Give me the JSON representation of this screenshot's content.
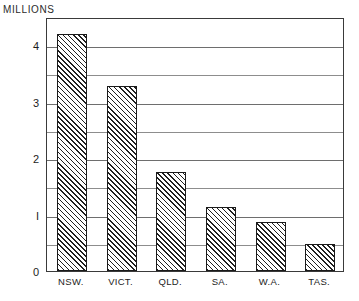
{
  "chart_data": {
    "type": "bar",
    "title": "",
    "axis_title": "MILLIONS",
    "xlabel": "",
    "ylabel": "MILLIONS",
    "categories": [
      "NSW.",
      "VICT.",
      "QLD.",
      "SA.",
      "W.A.",
      "TAS."
    ],
    "values": [
      4.2,
      3.28,
      1.75,
      1.14,
      0.86,
      0.47
    ],
    "ylim": [
      0,
      4.5
    ],
    "yticks": [
      0,
      1,
      2,
      3,
      4
    ],
    "ytick_labels": [
      "0",
      "I",
      "2",
      "3",
      "4"
    ],
    "minor_yticks": [
      0.5,
      1.5,
      2.5,
      3.5,
      4.5
    ],
    "grid": true,
    "legend": "none",
    "series": [
      {
        "name": "Population",
        "values": [
          4.2,
          3.28,
          1.75,
          1.14,
          0.86,
          0.47
        ]
      }
    ],
    "bar_fill": "diagonal-hatch",
    "bar_border_color": "#1a1a1a",
    "grid_color": "#6e6e6e",
    "frame_color": "#3a3a3a"
  }
}
